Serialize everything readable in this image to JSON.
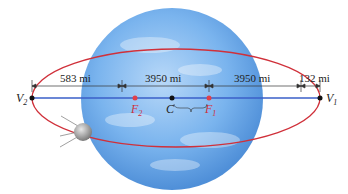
{
  "diagram": {
    "dimensions": {
      "left_gap": "583 mi",
      "left_radius": "3950 mi",
      "right_radius": "3950 mi",
      "right_gap": "132 mi"
    },
    "points": {
      "v2": {
        "letter": "V",
        "sub": "2"
      },
      "f2": {
        "letter": "F",
        "sub": "2"
      },
      "c": {
        "letter": "C"
      },
      "f1": {
        "letter": "F",
        "sub": "1"
      },
      "v1": {
        "letter": "V",
        "sub": "1"
      }
    },
    "colors": {
      "orbit": "#d0303a",
      "major_axis": "#3a5fc8",
      "focus": "#e0404a",
      "earth": "#6aa8e8"
    }
  }
}
